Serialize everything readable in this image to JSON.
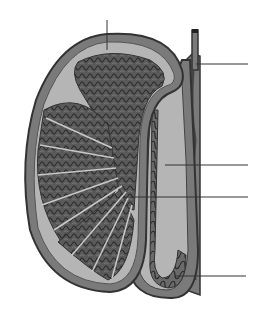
{
  "diagram": {
    "colors": {
      "background": "#ffffff",
      "outline": "#3a3a3a",
      "capsule_fill": "#7a7a7a",
      "inner_fill": "#b5b5b5",
      "lobule_fill": "#5a5a5a",
      "tubule_stroke": "#2a2a2a",
      "septum": "#c8c8c8",
      "leader_line": "#333333"
    },
    "leader_lines": [
      {
        "id": "top",
        "x1": 107,
        "y1": 20,
        "x2": 107,
        "y2": 50,
        "label": ""
      },
      {
        "id": "ductus",
        "x1": 200,
        "y1": 64,
        "x2": 248,
        "y2": 64,
        "label": ""
      },
      {
        "id": "epididymis-body",
        "x1": 165,
        "y1": 165,
        "x2": 248,
        "y2": 165,
        "label": ""
      },
      {
        "id": "rete",
        "x1": 130,
        "y1": 197,
        "x2": 248,
        "y2": 197,
        "label": ""
      },
      {
        "id": "epididymis-tail",
        "x1": 175,
        "y1": 276,
        "x2": 246,
        "y2": 276,
        "label": ""
      }
    ]
  }
}
